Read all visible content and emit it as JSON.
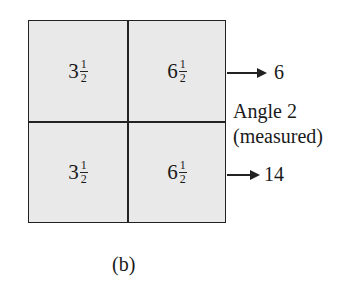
{
  "grid": {
    "cells": [
      {
        "whole": "3",
        "num": "1",
        "den": "2"
      },
      {
        "whole": "6",
        "num": "1",
        "den": "2"
      },
      {
        "whole": "3",
        "num": "1",
        "den": "2"
      },
      {
        "whole": "6",
        "num": "1",
        "den": "2"
      }
    ]
  },
  "arrows": {
    "top_value": "6",
    "bottom_value": "14"
  },
  "annotation": {
    "line1": "Angle 2",
    "line2": "(measured)"
  },
  "caption": "(b)"
}
